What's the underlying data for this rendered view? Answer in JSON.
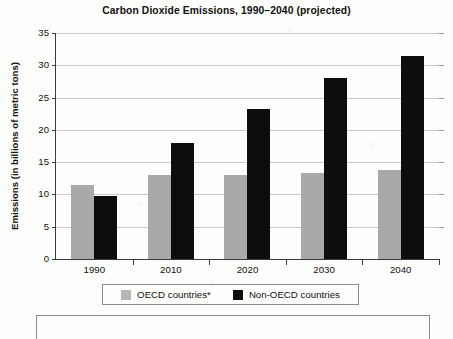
{
  "chart_data": {
    "type": "bar",
    "title": "Carbon Dioxide Emissions, 1990–2040 (projected)",
    "xlabel": "",
    "ylabel": "Emissions (in billions of metric tons)",
    "categories": [
      "1990",
      "2010",
      "2020",
      "2030",
      "2040"
    ],
    "series": [
      {
        "name": "OECD countries*",
        "color": "#a9a9a9",
        "values": [
          11.5,
          13.0,
          13.0,
          13.3,
          13.8
        ]
      },
      {
        "name": "Non-OECD countries",
        "color": "#0d0d0d",
        "values": [
          9.8,
          18.0,
          23.2,
          28.0,
          31.5
        ]
      }
    ],
    "ylim": [
      0,
      35
    ],
    "yticks": [
      "0",
      "5",
      "10",
      "15",
      "20",
      "25",
      "30",
      "35"
    ],
    "ytick_values": [
      0,
      5,
      10,
      15,
      20,
      25,
      30,
      35
    ],
    "grid": true,
    "grid_axis": "y",
    "legend_position": "bottom",
    "bar_mode": "grouped"
  },
  "legend": {
    "entries": [
      {
        "label": "OECD countries*",
        "swatch": "gray-swatch"
      },
      {
        "label": "Non-OECD countries",
        "swatch": "black-swatch"
      }
    ]
  }
}
